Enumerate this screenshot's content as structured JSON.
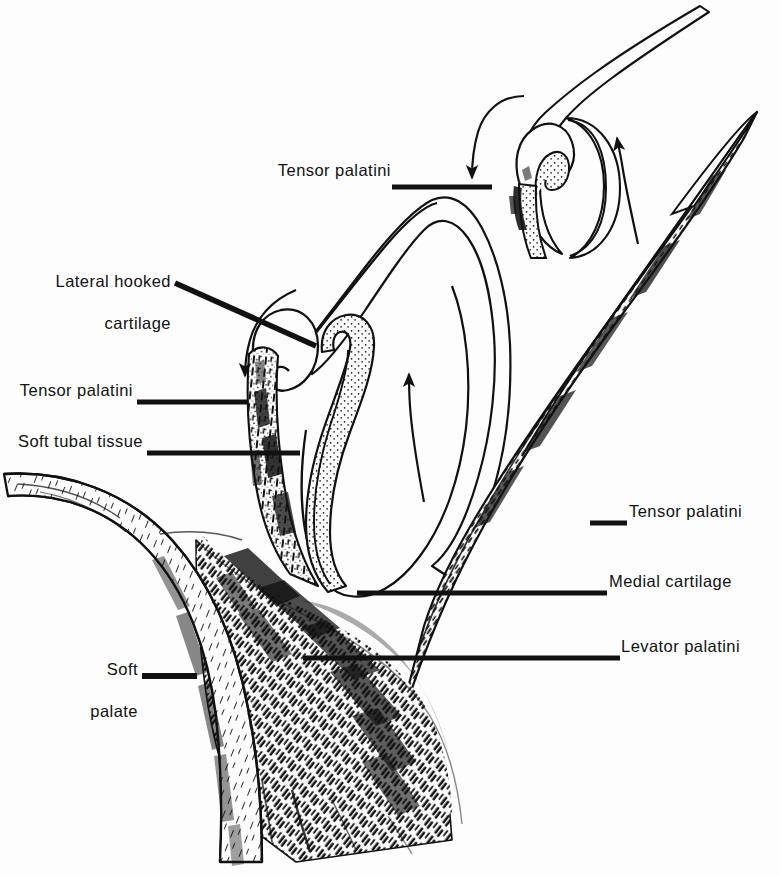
{
  "figure": {
    "type": "anatomical-line-drawing",
    "background_color": "#fdfdfd",
    "ink_color": "#111111",
    "width": 780,
    "height": 875
  },
  "labels": [
    {
      "id": "tensor-palatini-top",
      "text": "Tensor palatini",
      "lines": [
        "Tensor palatini"
      ],
      "align": "right",
      "x": 279,
      "y": 170,
      "leader": {
        "type": "horizontal-thick",
        "x1": 392,
        "y1": 187,
        "x2": 492,
        "y2": 187
      }
    },
    {
      "id": "lateral-hooked-cartilage",
      "text": "Lateral hooked cartilage",
      "lines": [
        "Lateral hooked",
        "cartilage"
      ],
      "align": "right",
      "x": 51,
      "y": 260,
      "leader": {
        "type": "diagonal-thick",
        "x1": 175,
        "y1": 283,
        "x2": 316,
        "y2": 346
      }
    },
    {
      "id": "tensor-palatini-left",
      "text": "Tensor palatini",
      "lines": [
        "Tensor palatini"
      ],
      "align": "right",
      "x": 23,
      "y": 390,
      "leader": {
        "type": "horizontal-thick",
        "x1": 137,
        "y1": 402,
        "x2": 248,
        "y2": 402
      }
    },
    {
      "id": "soft-tubal-tissue",
      "text": "Soft tubal tissue",
      "lines": [
        "Soft tubal tissue"
      ],
      "align": "right",
      "x": 15,
      "y": 440,
      "leader": {
        "type": "horizontal-thick",
        "x1": 147,
        "y1": 453,
        "x2": 300,
        "y2": 453
      }
    },
    {
      "id": "tensor-palatini-right",
      "text": "Tensor palatini",
      "lines": [
        "Tensor palatini"
      ],
      "align": "left",
      "x": 628,
      "y": 511,
      "leader": {
        "type": "horizontal-thick",
        "x1": 592,
        "y1": 523,
        "x2": 627,
        "y2": 523
      }
    },
    {
      "id": "medial-cartilage",
      "text": "Medial cartilage",
      "lines": [
        "Medial cartilage"
      ],
      "align": "left",
      "x": 609,
      "y": 580,
      "leader": {
        "type": "horizontal-thick",
        "x1": 357,
        "y1": 593,
        "x2": 607,
        "y2": 593
      }
    },
    {
      "id": "levator-palatini",
      "text": "Levator palatini",
      "lines": [
        "Levator palatini"
      ],
      "align": "left",
      "x": 622,
      "y": 645,
      "leader": {
        "type": "horizontal-thick",
        "x1": 303,
        "y1": 658,
        "x2": 620,
        "y2": 658
      }
    },
    {
      "id": "soft-palate",
      "text": "Soft palate",
      "lines": [
        "Soft",
        "palate"
      ],
      "align": "right",
      "x": 54,
      "y": 648,
      "leader": {
        "type": "horizontal-thick",
        "x1": 142,
        "y1": 676,
        "x2": 197,
        "y2": 676
      }
    }
  ],
  "arrows": [
    {
      "id": "arrow-down-upper",
      "direction": "down",
      "description": "curved arrow pointing down at upper tube lumen"
    },
    {
      "id": "arrow-up-upper-right",
      "direction": "up",
      "description": "curved arrow pointing up along upper tube"
    },
    {
      "id": "arrow-down-left-middle",
      "direction": "down-left",
      "description": "curved arrow pointing down-left at lateral hooked cartilage"
    },
    {
      "id": "arrow-up-middle",
      "direction": "up",
      "description": "curved arrow pointing up inside tube lumen"
    }
  ]
}
